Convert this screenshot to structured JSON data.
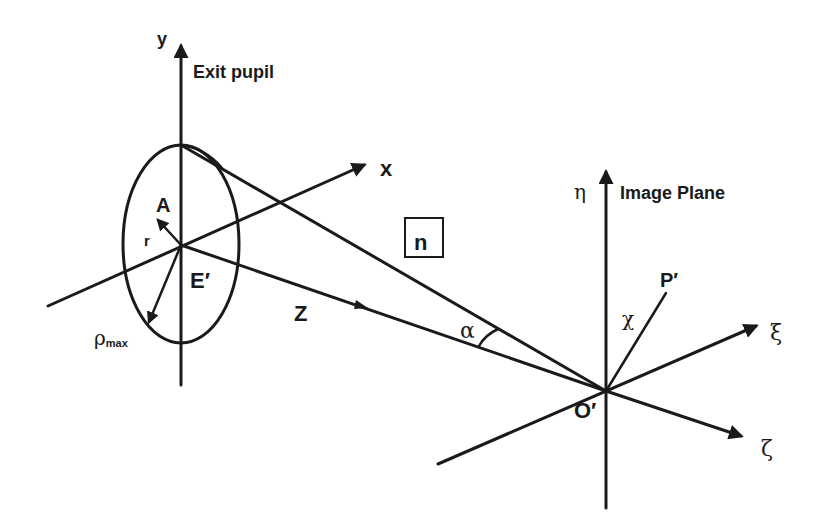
{
  "diagram": {
    "exit_pupil": {
      "label": "Exit pupil",
      "y_axis_label": "y",
      "x_axis_label": "x",
      "z_axis_label": "Z",
      "center_label": "E′",
      "point_label": "A",
      "radius_label": "r",
      "max_radius_label": "ρ",
      "max_radius_subscript": "max"
    },
    "medium": {
      "index_label": "n"
    },
    "angle": {
      "label": "α"
    },
    "image_plane": {
      "label": "Image Plane",
      "eta_label": "η",
      "xi_label": "ξ",
      "zeta_label": "ζ",
      "origin_label": "O′",
      "point_label": "P′",
      "chi_label": "χ"
    }
  }
}
